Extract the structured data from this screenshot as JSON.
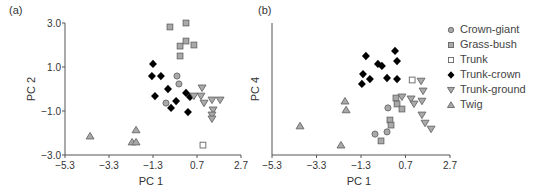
{
  "chart_data": [
    {
      "panel_label": "(a)",
      "type": "scatter",
      "xlabel": "PC 1",
      "ylabel": "PC 2",
      "xlim": [
        -5.3,
        2.7
      ],
      "ylim": [
        -3.0,
        3.0
      ],
      "xticks": [
        "-5.3",
        "-3.3",
        "-1.3",
        "0.7",
        "2.7"
      ],
      "yticks": [
        "3.0",
        "1.0",
        "-1.0",
        "-3.0"
      ],
      "grid": false,
      "series": [
        {
          "name": "Crown-giant",
          "marker": "circle",
          "points": [
            [
              -0.21,
              0.59
            ],
            [
              -0.12,
              0.23
            ],
            [
              -0.71,
              -0.64
            ]
          ]
        },
        {
          "name": "Grass-bush",
          "marker": "square-filled",
          "points": [
            [
              -0.53,
              2.82
            ],
            [
              0.2,
              3.0
            ],
            [
              -0.07,
              1.95
            ],
            [
              0.2,
              2.18
            ],
            [
              0.56,
              2.0
            ],
            [
              -0.07,
              1.5
            ]
          ]
        },
        {
          "name": "Trunk",
          "marker": "square-open",
          "points": [
            [
              0.97,
              -2.55
            ]
          ]
        },
        {
          "name": "Trunk-crown",
          "marker": "diamond",
          "points": [
            [
              -1.3,
              1.14
            ],
            [
              -1.35,
              0.59
            ],
            [
              -0.94,
              0.59
            ],
            [
              -0.62,
              0.0
            ],
            [
              -1.21,
              -0.32
            ],
            [
              0.2,
              -0.18
            ],
            [
              0.38,
              -0.36
            ],
            [
              -0.25,
              -0.55
            ],
            [
              -0.48,
              -0.86
            ],
            [
              0.29,
              -1.05
            ]
          ]
        },
        {
          "name": "Trunk-ground",
          "marker": "triangle-down",
          "points": [
            [
              0.56,
              -0.32
            ],
            [
              0.93,
              0.05
            ],
            [
              0.88,
              -0.32
            ],
            [
              1.02,
              -0.64
            ],
            [
              1.38,
              -0.5
            ],
            [
              1.75,
              -0.5
            ],
            [
              1.43,
              -0.95
            ],
            [
              1.38,
              -1.18
            ],
            [
              1.38,
              -1.36
            ]
          ]
        },
        {
          "name": "Twig",
          "marker": "triangle-up",
          "points": [
            [
              -4.16,
              -2.14
            ],
            [
              -2.07,
              -1.86
            ],
            [
              -2.25,
              -2.41
            ],
            [
              -2.07,
              -2.41
            ]
          ]
        }
      ]
    },
    {
      "panel_label": "(b)",
      "type": "scatter",
      "xlabel": "PC 1",
      "ylabel": "PC 4",
      "xlim": [
        -5.3,
        2.7
      ],
      "ylim": [
        -3.0,
        3.0
      ],
      "xticks": [
        "-5.3",
        "-3.3",
        "-1.3",
        "0.7",
        "2.7"
      ],
      "yticks": [],
      "grid": false,
      "series": [
        {
          "name": "Crown-giant",
          "marker": "circle",
          "points": [
            [
              -0.09,
              -0.86
            ],
            [
              -0.67,
              -2.05
            ],
            [
              -0.13,
              -1.95
            ]
          ]
        },
        {
          "name": "Grass-bush",
          "marker": "square-filled",
          "points": [
            [
              0.27,
              -0.41
            ],
            [
              0.32,
              -0.68
            ],
            [
              0.54,
              -0.91
            ],
            [
              0.0,
              -1.41
            ],
            [
              0.05,
              -1.64
            ],
            [
              -0.4,
              -2.36
            ]
          ]
        },
        {
          "name": "Trunk",
          "marker": "square-open",
          "points": [
            [
              1.0,
              0.41
            ]
          ]
        },
        {
          "name": "Trunk-crown",
          "marker": "diamond",
          "points": [
            [
              -1.08,
              1.5
            ],
            [
              0.23,
              1.73
            ],
            [
              -0.54,
              1.14
            ],
            [
              -0.36,
              1.05
            ],
            [
              0.32,
              1.27
            ],
            [
              -1.21,
              0.68
            ],
            [
              -0.9,
              0.45
            ],
            [
              -0.13,
              0.5
            ],
            [
              0.32,
              0.45
            ],
            [
              -1.26,
              0.23
            ]
          ]
        },
        {
          "name": "Trunk-ground",
          "marker": "triangle-down",
          "points": [
            [
              1.4,
              0.36
            ],
            [
              1.49,
              -0.09
            ],
            [
              0.54,
              -0.36
            ],
            [
              0.95,
              -0.45
            ],
            [
              1.08,
              -0.68
            ],
            [
              1.44,
              -0.55
            ],
            [
              1.44,
              -1.18
            ],
            [
              1.58,
              -1.55
            ],
            [
              1.85,
              -1.82
            ]
          ]
        },
        {
          "name": "Twig",
          "marker": "triangle-up",
          "points": [
            [
              -4.04,
              -1.68
            ],
            [
              -2.02,
              -0.55
            ],
            [
              -1.97,
              -0.95
            ],
            [
              -2.2,
              -2.55
            ]
          ]
        }
      ]
    }
  ],
  "legend": {
    "position": "right",
    "items": [
      {
        "label": "Crown-giant",
        "marker": "circle"
      },
      {
        "label": "Grass-bush",
        "marker": "square-filled"
      },
      {
        "label": "Trunk",
        "marker": "square-open"
      },
      {
        "label": "Trunk-crown",
        "marker": "diamond"
      },
      {
        "label": "Trunk-ground",
        "marker": "triangle-down"
      },
      {
        "label": "Twig",
        "marker": "triangle-up"
      }
    ]
  },
  "colors": {
    "axis": "#555555",
    "marker_fill_gray": "#a9a9a9",
    "marker_stroke": "#666666",
    "marker_black": "#000000",
    "marker_open_fill": "#ffffff",
    "text": "#333333"
  }
}
